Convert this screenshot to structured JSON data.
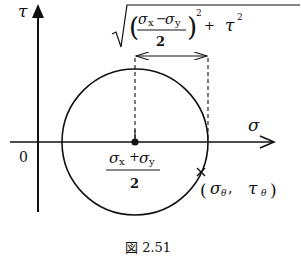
{
  "diagram": {
    "type": "mohr-circle",
    "axes": {
      "vertical_label": "τ",
      "horizontal_label": "σ",
      "origin_label": "0"
    },
    "center_label": {
      "numerator": "σx + σy",
      "numerator_a": "σ",
      "numerator_a_sub": "x",
      "numerator_op": "+",
      "numerator_b": "σ",
      "numerator_b_sub": "y",
      "denominator": "2"
    },
    "radius_label": {
      "inner_numerator_a": "σ",
      "inner_numerator_a_sub": "x",
      "inner_op": "−",
      "inner_numerator_b": "σ",
      "inner_numerator_b_sub": "y",
      "inner_denominator": "2",
      "exponent": "2",
      "plus": "+",
      "tau": "τ",
      "tau_exp": "2"
    },
    "point_label": {
      "open": "(",
      "sigma": "σ",
      "sigma_sub": "θ",
      "comma": ",",
      "tau": "τ",
      "tau_sub": "θ",
      "close": ")"
    },
    "caption": "図 2.51",
    "colors": {
      "ink": "#111111",
      "background": "#ffffff"
    }
  }
}
